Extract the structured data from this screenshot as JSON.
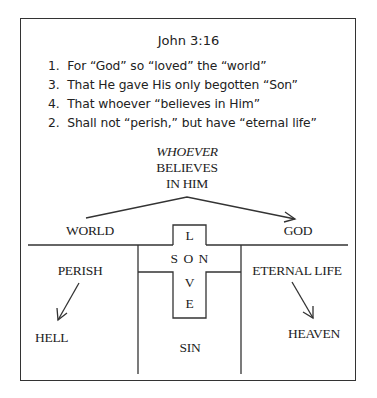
{
  "title": "John 3:16",
  "verses": [
    {
      "num": "1.",
      "text": "For “God” so “loved” the “world”"
    },
    {
      "num": "3.",
      "text": "That He gave His only begotten “Son”"
    },
    {
      "num": "4.",
      "text": "That whoever “believes in Him”"
    },
    {
      "num": "2.",
      "text": "Shall not “perish,” but have “eternal life”"
    }
  ],
  "diagram": {
    "bridge_label": {
      "line1": "WHOEVER",
      "line2": "BELIEVES",
      "line3": "IN HIM"
    },
    "world": "WORLD",
    "god": "GOD",
    "perish": "PERISH",
    "hell": "HELL",
    "eternal_life": "ETERNAL LIFE",
    "heaven": "HEAVEN",
    "sin": "SIN",
    "cross": {
      "top": "L",
      "middle": "S O N",
      "lower1": "V",
      "lower2": "E"
    }
  }
}
